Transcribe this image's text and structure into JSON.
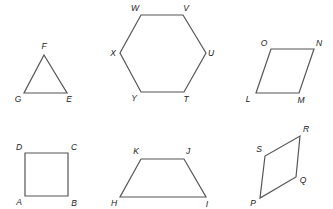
{
  "shapes": [
    {
      "name": "triangle",
      "points": [
        [
          44,
          55
        ],
        [
          67,
          93
        ],
        [
          24,
          93
        ]
      ],
      "labels": [
        {
          "text": "F",
          "x": 44,
          "y": 47
        },
        {
          "text": "G",
          "x": 18,
          "y": 100
        },
        {
          "text": "E",
          "x": 69,
          "y": 100
        }
      ]
    },
    {
      "name": "hexagon",
      "points": [
        [
          141,
          15
        ],
        [
          183,
          15
        ],
        [
          206,
          53
        ],
        [
          184,
          92
        ],
        [
          141,
          92
        ],
        [
          120,
          53
        ]
      ],
      "labels": [
        {
          "text": "W",
          "x": 135,
          "y": 9
        },
        {
          "text": "V",
          "x": 186,
          "y": 9
        },
        {
          "text": "X",
          "x": 113,
          "y": 54
        },
        {
          "text": "U",
          "x": 211,
          "y": 54
        },
        {
          "text": "Y",
          "x": 134,
          "y": 99
        },
        {
          "text": "T",
          "x": 186,
          "y": 100
        }
      ]
    },
    {
      "name": "parallelogram",
      "points": [
        [
          271,
          49
        ],
        [
          314,
          49
        ],
        [
          299,
          93
        ],
        [
          256,
          93
        ]
      ],
      "labels": [
        {
          "text": "O",
          "x": 264,
          "y": 44
        },
        {
          "text": "N",
          "x": 319,
          "y": 44
        },
        {
          "text": "L",
          "x": 248,
          "y": 100
        },
        {
          "text": "M",
          "x": 301,
          "y": 101
        }
      ]
    },
    {
      "name": "square",
      "points": [
        [
          25,
          153
        ],
        [
          68,
          153
        ],
        [
          68,
          196
        ],
        [
          25,
          196
        ]
      ],
      "labels": [
        {
          "text": "D",
          "x": 19,
          "y": 148
        },
        {
          "text": "C",
          "x": 74,
          "y": 148
        },
        {
          "text": "A",
          "x": 19,
          "y": 203
        },
        {
          "text": "B",
          "x": 74,
          "y": 204
        }
      ]
    },
    {
      "name": "trapezoid",
      "points": [
        [
          141,
          159
        ],
        [
          184,
          159
        ],
        [
          206,
          197
        ],
        [
          120,
          197
        ]
      ],
      "labels": [
        {
          "text": "K",
          "x": 136,
          "y": 152
        },
        {
          "text": "J",
          "x": 188,
          "y": 152
        },
        {
          "text": "H",
          "x": 114,
          "y": 204
        },
        {
          "text": "I",
          "x": 207,
          "y": 205
        }
      ]
    },
    {
      "name": "rhombus",
      "points": [
        [
          300,
          136
        ],
        [
          296,
          177
        ],
        [
          260,
          198
        ],
        [
          265,
          156
        ]
      ],
      "labels": [
        {
          "text": "R",
          "x": 306,
          "y": 130
        },
        {
          "text": "S",
          "x": 259,
          "y": 150
        },
        {
          "text": "Q",
          "x": 303,
          "y": 181
        },
        {
          "text": "P",
          "x": 253,
          "y": 204
        }
      ]
    }
  ]
}
